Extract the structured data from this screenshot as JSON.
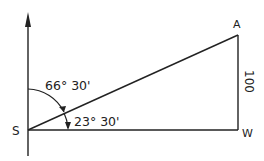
{
  "diagram": {
    "type": "bearing-triangle",
    "colors": {
      "stroke": "#222222",
      "background": "#ffffff"
    },
    "points": {
      "S": {
        "label": "S"
      },
      "A": {
        "label": "A"
      },
      "W": {
        "label": "W"
      }
    },
    "angles": {
      "from_north": "66° 30'",
      "from_horizontal": "23° 30'"
    },
    "side_AW": {
      "label": "100"
    }
  }
}
